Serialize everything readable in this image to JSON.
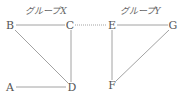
{
  "groups": [
    {
      "title": "グループX",
      "tx": 46,
      "ty": 11
    },
    {
      "title": "グループY",
      "tx": 140,
      "ty": 11
    }
  ],
  "nodes": {
    "A": {
      "label": "A",
      "x": 10,
      "y": 87
    },
    "B": {
      "label": "B",
      "x": 10,
      "y": 25
    },
    "C": {
      "label": "C",
      "x": 70,
      "y": 25
    },
    "D": {
      "label": "D",
      "x": 72,
      "y": 87
    },
    "E": {
      "label": "E",
      "x": 112,
      "y": 25
    },
    "F": {
      "label": "F",
      "x": 112,
      "y": 85
    },
    "G": {
      "label": "G",
      "x": 173,
      "y": 25
    }
  },
  "edges": [
    {
      "from": "B",
      "to": "C",
      "style": "solid"
    },
    {
      "from": "B",
      "to": "D",
      "style": "solid"
    },
    {
      "from": "C",
      "to": "D",
      "style": "solid"
    },
    {
      "from": "A",
      "to": "D",
      "style": "solid"
    },
    {
      "from": "E",
      "to": "G",
      "style": "solid"
    },
    {
      "from": "E",
      "to": "F",
      "style": "solid"
    },
    {
      "from": "F",
      "to": "G",
      "style": "solid"
    },
    {
      "from": "C",
      "to": "E",
      "style": "dotted"
    }
  ],
  "colors": {
    "line": "#888888",
    "text": "#555555"
  }
}
